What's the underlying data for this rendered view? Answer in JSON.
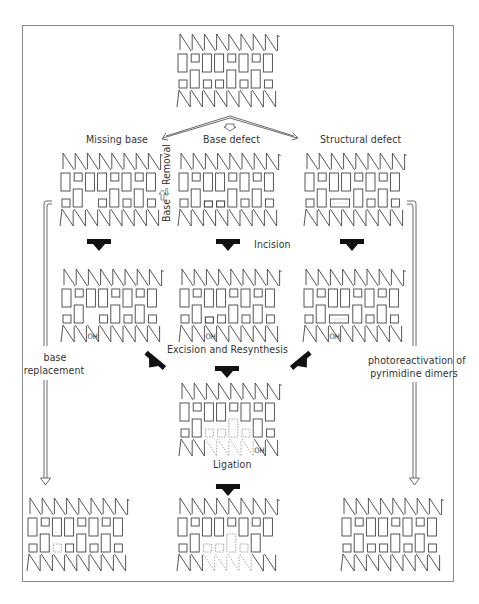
{
  "labels": {
    "missing_base": "Missing base",
    "base_defect": "Base defect",
    "structural_defect": "Structural defect",
    "base_removal": "Base ⇦ Removal",
    "incision": "Incision",
    "excision_resynthesis": "Excision and Resynthesis",
    "ligation": "Ligation",
    "base_replacement_1": "base",
    "base_replacement_2": "replacement",
    "photoreactivation_1": "photoreactivation of",
    "photoreactivation_2": "pyrimidine dimers",
    "oh": "OH"
  },
  "colors": {
    "line": "#444444",
    "arrow": "#111111",
    "frame": "#8a8a8a",
    "dotted": "#9a9a9a"
  },
  "blocks": [
    {
      "id": "original",
      "top": "TSTTSTST",
      "bottom": "STSSTSTS"
    },
    {
      "id": "missing-base",
      "top": "TSTTSTST",
      "bottom": "ST-STSTS"
    },
    {
      "id": "base-defect",
      "top": "TSTTSTST",
      "bottom": "STssTSTS"
    },
    {
      "id": "structural-defect",
      "top": "TSTTSTST",
      "bottom": "ST==TSTS",
      "dimer": true
    },
    {
      "id": "incision-missing",
      "top": "TSTTSTST",
      "bottom": "ST-STSTS",
      "nick": 1
    },
    {
      "id": "incision-defect",
      "top": "TSTTSTST",
      "bottom": "STdSTSTS",
      "nick": 1
    },
    {
      "id": "incision-structural",
      "top": "TSTTSTST",
      "bottom": "ST==TSTS",
      "nick": 1,
      "dimer": true
    },
    {
      "id": "excised",
      "top": "TSTTSTST",
      "bottom": "STxxXxTS",
      "dottedBackbone": [
        2,
        3,
        4,
        5
      ],
      "oh": 5
    },
    {
      "id": "repaired-base",
      "top": "TSTTSTST",
      "bottom": "STxSTSTS"
    },
    {
      "id": "ligated",
      "top": "TSTTSTST",
      "bottom": "STxxXxT-",
      "dottedBackbone": [
        2,
        3,
        4,
        5
      ]
    },
    {
      "id": "photoreactivated",
      "top": "TSTTSTST",
      "bottom": "STSSTSTS"
    }
  ]
}
